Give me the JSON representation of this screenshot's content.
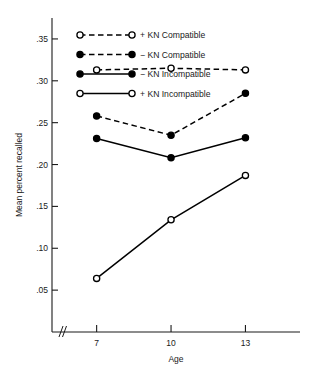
{
  "chart_data": {
    "type": "line",
    "title": "",
    "xlabel": "Age",
    "ylabel": "Mean percent recalled",
    "x": [
      7,
      10,
      13
    ],
    "categories": [
      "7",
      "10",
      "13"
    ],
    "xtick_labels": [
      "7",
      "10",
      "13"
    ],
    "ytick_labels": [
      ".05",
      ".10",
      ".15",
      ".20",
      ".25",
      ".30",
      ".35"
    ],
    "ytick_values": [
      0.05,
      0.1,
      0.15,
      0.2,
      0.25,
      0.3,
      0.35
    ],
    "ylim": [
      0.0,
      0.375
    ],
    "xlim": [
      5.2,
      15.2
    ],
    "grid": false,
    "axis_break": true,
    "axis_break_symbol": "//",
    "legend_position": "upper-left-inside",
    "series": [
      {
        "name": "+ KN Compatible",
        "values": [
          0.313,
          0.315,
          0.313
        ],
        "marker": "open-circle",
        "linestyle": "dashed",
        "color": "#000000"
      },
      {
        "name": "− KN Compatible",
        "values": [
          0.258,
          0.235,
          0.285
        ],
        "marker": "filled-circle",
        "linestyle": "dashed",
        "color": "#000000"
      },
      {
        "name": "− KN Incompatible",
        "values": [
          0.231,
          0.208,
          0.232
        ],
        "marker": "filled-circle",
        "linestyle": "solid",
        "color": "#000000"
      },
      {
        "name": "+ KN Incompatible",
        "values": [
          0.064,
          0.134,
          0.187
        ],
        "marker": "open-circle",
        "linestyle": "solid",
        "color": "#000000"
      }
    ]
  },
  "legend": {
    "entries": [
      {
        "label": "+ KN Compatible"
      },
      {
        "label": "− KN Compatible"
      },
      {
        "label": "− KN Incompatible"
      },
      {
        "label": "+ KN Incompatible"
      }
    ]
  },
  "axes": {
    "y_title": "Mean percent recalled",
    "x_title": "Age"
  }
}
